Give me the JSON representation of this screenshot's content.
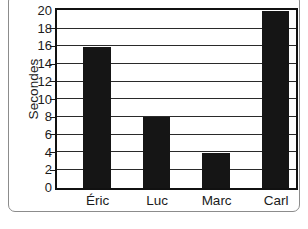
{
  "chart_data": {
    "type": "bar",
    "title": "",
    "subtitle": "",
    "xlabel": "",
    "ylabel": "Secondes",
    "categories": [
      "Éric",
      "Luc",
      "Marc",
      "Carl"
    ],
    "values": [
      16,
      8,
      4,
      20
    ],
    "series": [
      {
        "name": "Secondes",
        "values": [
          16,
          8,
          4,
          20
        ]
      }
    ],
    "ylim": [
      0,
      20
    ],
    "ytick_labels": [
      "0",
      "2",
      "4",
      "6",
      "8",
      "10",
      "12",
      "14",
      "16",
      "18",
      "20"
    ],
    "ytick_values": [
      0,
      2,
      4,
      6,
      8,
      10,
      12,
      14,
      16,
      18,
      20
    ],
    "grid": "horizontal",
    "legend": "none",
    "annotations": [],
    "colors": {
      "bar_fill": "#151515",
      "plot_background": "#ffffff",
      "axis_line": "#111111",
      "gridline": "#2a2a2a",
      "text": "#1b1b1b",
      "outer_frame": "#8c8c8c"
    }
  }
}
